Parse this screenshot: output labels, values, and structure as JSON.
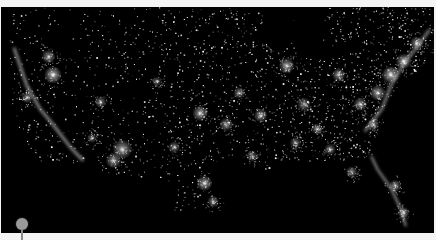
{
  "image": {
    "subject": "Night-time satellite view of city lights across the continental United States",
    "background_color": "#000000",
    "light_color": "#ffffff"
  },
  "marker": {
    "type": "map-pin",
    "color": "#9a9a9a"
  },
  "cities": [
    {
      "x": 0.12,
      "y": 0.3,
      "r": 9,
      "b": 1.0
    },
    {
      "x": 0.11,
      "y": 0.22,
      "r": 7,
      "b": 0.8
    },
    {
      "x": 0.06,
      "y": 0.4,
      "r": 6,
      "b": 0.7
    },
    {
      "x": 0.28,
      "y": 0.63,
      "r": 10,
      "b": 0.9
    },
    {
      "x": 0.26,
      "y": 0.68,
      "r": 8,
      "b": 0.8
    },
    {
      "x": 0.23,
      "y": 0.42,
      "r": 6,
      "b": 0.7
    },
    {
      "x": 0.46,
      "y": 0.47,
      "r": 8,
      "b": 0.9
    },
    {
      "x": 0.52,
      "y": 0.52,
      "r": 7,
      "b": 0.7
    },
    {
      "x": 0.47,
      "y": 0.78,
      "r": 8,
      "b": 0.9
    },
    {
      "x": 0.49,
      "y": 0.86,
      "r": 6,
      "b": 0.7
    },
    {
      "x": 0.55,
      "y": 0.38,
      "r": 6,
      "b": 0.7
    },
    {
      "x": 0.6,
      "y": 0.48,
      "r": 7,
      "b": 0.8
    },
    {
      "x": 0.66,
      "y": 0.26,
      "r": 8,
      "b": 0.9
    },
    {
      "x": 0.63,
      "y": 0.17,
      "r": 7,
      "b": 0.8
    },
    {
      "x": 0.7,
      "y": 0.43,
      "r": 7,
      "b": 0.7
    },
    {
      "x": 0.73,
      "y": 0.54,
      "r": 6,
      "b": 0.7
    },
    {
      "x": 0.78,
      "y": 0.3,
      "r": 7,
      "b": 0.8
    },
    {
      "x": 0.83,
      "y": 0.43,
      "r": 7,
      "b": 0.8
    },
    {
      "x": 0.76,
      "y": 0.63,
      "r": 6,
      "b": 0.7
    },
    {
      "x": 0.81,
      "y": 0.73,
      "r": 6,
      "b": 0.7
    },
    {
      "x": 0.87,
      "y": 0.38,
      "r": 8,
      "b": 0.9
    },
    {
      "x": 0.9,
      "y": 0.3,
      "r": 9,
      "b": 1.0
    },
    {
      "x": 0.93,
      "y": 0.24,
      "r": 8,
      "b": 0.9
    },
    {
      "x": 0.96,
      "y": 0.16,
      "r": 7,
      "b": 0.8
    },
    {
      "x": 0.86,
      "y": 0.52,
      "r": 6,
      "b": 0.7
    },
    {
      "x": 0.91,
      "y": 0.79,
      "r": 6,
      "b": 0.8
    },
    {
      "x": 0.93,
      "y": 0.91,
      "r": 6,
      "b": 0.8
    },
    {
      "x": 0.36,
      "y": 0.33,
      "r": 5,
      "b": 0.6
    },
    {
      "x": 0.4,
      "y": 0.62,
      "r": 6,
      "b": 0.7
    },
    {
      "x": 0.58,
      "y": 0.66,
      "r": 6,
      "b": 0.6
    },
    {
      "x": 0.68,
      "y": 0.6,
      "r": 6,
      "b": 0.6
    },
    {
      "x": 0.21,
      "y": 0.58,
      "r": 5,
      "b": 0.6
    }
  ],
  "lakes": [
    {
      "x": 0.64,
      "y": 0.08,
      "rx": 0.035,
      "ry": 0.12
    },
    {
      "x": 0.71,
      "y": 0.1,
      "rx": 0.045,
      "ry": 0.06
    },
    {
      "x": 0.74,
      "y": 0.2,
      "rx": 0.04,
      "ry": 0.03
    },
    {
      "x": 0.8,
      "y": 0.18,
      "rx": 0.035,
      "ry": 0.025
    },
    {
      "x": 0.68,
      "y": 0.02,
      "rx": 0.07,
      "ry": 0.03
    }
  ]
}
